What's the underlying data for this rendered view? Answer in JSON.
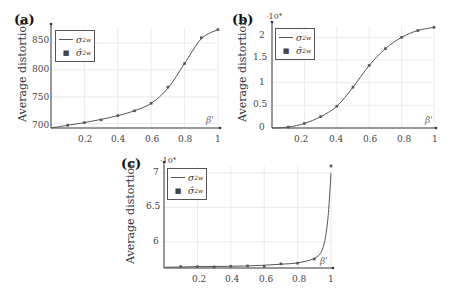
{
  "figure": {
    "panels": [
      {
        "label": "(a)",
        "ylabel": "Average distortion",
        "xlabel": "β'",
        "exponent": "",
        "yticks": [
          "700",
          "750",
          "800",
          "850"
        ],
        "xticks": [
          "0.2",
          "0.4",
          "0.6",
          "0.8",
          "1"
        ],
        "legend": {
          "line_label": "σ",
          "line_sup": "2",
          "line_sub": "w",
          "marker_label": "σ̂",
          "marker_sup": "2",
          "marker_sub": "w"
        }
      },
      {
        "label": "(b)",
        "ylabel": "Average distortion",
        "xlabel": "β'",
        "exponent": "·10⁴",
        "yticks": [
          "0",
          "0.5",
          "1",
          "1.5",
          "2"
        ],
        "xticks": [
          "0.2",
          "0.4",
          "0.6",
          "0.8",
          "1"
        ],
        "legend": {
          "line_label": "σ",
          "line_sup": "2",
          "line_sub": "w",
          "marker_label": "σ̂",
          "marker_sup": "2",
          "marker_sub": "w"
        }
      },
      {
        "label": "(c)",
        "ylabel": "Average distortion",
        "xlabel": "β'",
        "exponent": "·10⁴",
        "yticks": [
          "6",
          "6.5",
          "7"
        ],
        "xticks": [
          "0.2",
          "0.4",
          "0.6",
          "0.8",
          "1"
        ],
        "legend": {
          "line_label": "σ",
          "line_sup": "2",
          "line_sub": "w",
          "marker_label": "σ̂",
          "marker_sup": "2",
          "marker_sub": "w"
        }
      }
    ]
  },
  "chart_data": [
    {
      "type": "line",
      "title": "(a)",
      "xlabel": "β'",
      "ylabel": "Average distortion",
      "xlim": [
        0,
        1
      ],
      "ylim": [
        692,
        878
      ],
      "grid": true,
      "legend_position": "upper left",
      "x": [
        0.0,
        0.1,
        0.2,
        0.3,
        0.4,
        0.5,
        0.6,
        0.7,
        0.8,
        0.9,
        1.0
      ],
      "series": [
        {
          "name": "σ_w^2",
          "style": "line",
          "values": [
            692,
            697,
            702,
            708,
            715,
            724,
            738,
            766,
            812,
            858,
            875
          ]
        },
        {
          "name": "σ̂_w^2",
          "style": "marker",
          "x": [
            0.1,
            0.2,
            0.3,
            0.4,
            0.5,
            0.6,
            0.7,
            0.8,
            0.9,
            1.0
          ],
          "values": [
            697,
            702,
            707,
            715,
            724,
            738,
            768,
            812,
            860,
            875
          ]
        }
      ]
    },
    {
      "type": "line",
      "title": "(b)",
      "xlabel": "β'",
      "ylabel": "Average distortion (×10^4)",
      "xlim": [
        0,
        1
      ],
      "ylim": [
        0,
        2.25
      ],
      "grid": true,
      "legend_position": "upper left",
      "x": [
        0.0,
        0.1,
        0.2,
        0.3,
        0.4,
        0.5,
        0.6,
        0.7,
        0.8,
        0.9,
        1.0
      ],
      "series": [
        {
          "name": "σ_w^2",
          "style": "line",
          "values": [
            0.0,
            0.02,
            0.1,
            0.25,
            0.48,
            0.9,
            1.38,
            1.75,
            2.0,
            2.15,
            2.22
          ]
        },
        {
          "name": "σ̂_w^2",
          "style": "marker",
          "x": [
            0.1,
            0.2,
            0.3,
            0.4,
            0.5,
            0.6,
            0.7,
            0.8,
            0.9,
            1.0
          ],
          "values": [
            0.02,
            0.1,
            0.25,
            0.48,
            0.9,
            1.38,
            1.75,
            2.0,
            2.15,
            2.22
          ]
        }
      ]
    },
    {
      "type": "line",
      "title": "(c)",
      "xlabel": "β'",
      "ylabel": "Average distortion (×10^4)",
      "xlim": [
        0,
        1
      ],
      "ylim": [
        5.62,
        7.1
      ],
      "grid": true,
      "legend_position": "upper left",
      "x": [
        0.0,
        0.1,
        0.2,
        0.3,
        0.4,
        0.5,
        0.6,
        0.7,
        0.8,
        0.9,
        0.95,
        0.98,
        1.0
      ],
      "series": [
        {
          "name": "σ_w^2",
          "style": "line",
          "values": [
            5.63,
            5.635,
            5.64,
            5.642,
            5.645,
            5.65,
            5.66,
            5.675,
            5.695,
            5.76,
            5.9,
            6.3,
            7.0
          ]
        },
        {
          "name": "σ̂_w^2",
          "style": "marker",
          "x": [
            0.1,
            0.2,
            0.3,
            0.4,
            0.5,
            0.6,
            0.7,
            0.8,
            0.9,
            1.0
          ],
          "values": [
            5.64,
            5.64,
            5.635,
            5.645,
            5.65,
            5.645,
            5.68,
            5.69,
            5.75,
            7.1
          ]
        }
      ]
    }
  ]
}
